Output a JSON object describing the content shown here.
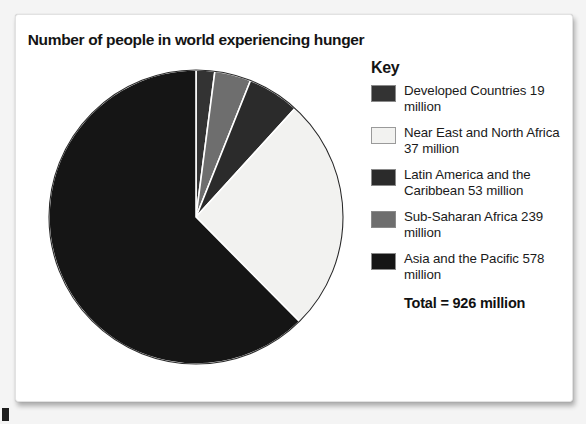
{
  "figure": {
    "title": "Number of people in world experiencing hunger"
  },
  "legend": {
    "heading": "Key",
    "items": [
      {
        "label": "Developed Countries 19 million",
        "color": "#333333",
        "icon": "legend-swatch-icon"
      },
      {
        "label": "Near East and North Africa 37 million",
        "color": "#f2f2f0",
        "icon": "legend-swatch-icon"
      },
      {
        "label": "Latin America and the Caribbean 53 million",
        "color": "#2b2b2b",
        "icon": "legend-swatch-icon"
      },
      {
        "label": "Sub-Saharan Africa 239 million",
        "color": "#6e6e6e",
        "icon": "legend-swatch-icon"
      },
      {
        "label": "Asia and the Pacific 578 million",
        "color": "#151515",
        "icon": "legend-swatch-icon"
      }
    ],
    "total": "Total = 926 million"
  },
  "chart_data": {
    "type": "pie",
    "title": "Number of people in world experiencing hunger",
    "unit": "million people",
    "total": 926,
    "total_label": "Total = 926 million",
    "legend_position": "right",
    "legend_title": "Key",
    "start_angle_deg": 0,
    "direction": "clockwise",
    "categories": [
      "Developed Countries",
      "Near East and North Africa",
      "Latin America and the Caribbean",
      "Sub-Saharan Africa",
      "Asia and the Pacific"
    ],
    "values": [
      19,
      37,
      53,
      239,
      578
    ],
    "value_labels": [
      "19 million",
      "37 million",
      "53 million",
      "239 million",
      "578 million"
    ],
    "colors": [
      "#333333",
      "#f2f2f0",
      "#2b2b2b",
      "#6e6e6e",
      "#151515"
    ],
    "slices_drawn_clockwise_from_top": [
      {
        "name": "Developed Countries",
        "value": 19,
        "angle_deg": 7.4,
        "color": "#333333"
      },
      {
        "name": "Sub-Saharan Africa",
        "value": 37,
        "angle_deg": 14.4,
        "color": "#6e6e6e"
      },
      {
        "name": "Latin America and the Caribbean",
        "value": 53,
        "angle_deg": 20.6,
        "color": "#2b2b2b"
      },
      {
        "name": "Near East and North Africa",
        "value": 239,
        "angle_deg": 92.9,
        "color": "#f2f2f0"
      },
      {
        "name": "Asia and the Pacific",
        "value": 578,
        "angle_deg": 224.7,
        "color": "#151515"
      }
    ],
    "xlabel": "",
    "ylabel": "",
    "grid": false
  }
}
